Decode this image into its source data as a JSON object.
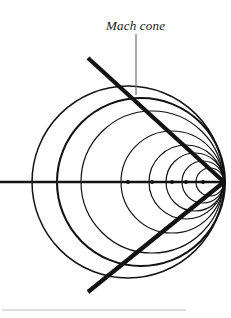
{
  "figure": {
    "title_label": "Mach cone",
    "background_color": "#ffffff",
    "line_color": "#121212",
    "leader_line_color": "#6e6e6e",
    "rule_color": "#b9b9b9",
    "apex": {
      "x": 224,
      "y": 182
    },
    "axis": {
      "y": 182,
      "x_start": 0,
      "x_end": 224,
      "stroke_width": 2.6
    },
    "cone": {
      "half_angle_deg": 45,
      "upper_line": {
        "x1": 88,
        "y1": 58,
        "x2": 224,
        "y2": 182
      },
      "lower_line": {
        "x1": 88,
        "y1": 292,
        "x2": 224,
        "y2": 182
      },
      "stroke_width": 4.2
    },
    "leader": {
      "x": 136,
      "y_top": 34,
      "y_bottom": 95,
      "stroke_width": 1.2
    },
    "bottom_rule": {
      "x1": 2,
      "x2": 186,
      "y": 310,
      "stroke_width": 1.2
    },
    "wave_circles": [
      {
        "cx": 128,
        "cy": 182,
        "r": 96,
        "stroke_width": 1.5
      },
      {
        "cx": 141,
        "cy": 182,
        "r": 84,
        "stroke_width": 2.1
      },
      {
        "cx": 152,
        "cy": 182,
        "r": 71,
        "stroke_width": 1.2
      },
      {
        "cx": 172,
        "cy": 182,
        "r": 51,
        "stroke_width": 1.2
      },
      {
        "cx": 186,
        "cy": 182,
        "r": 37,
        "stroke_width": 1.2
      },
      {
        "cx": 195,
        "cy": 182,
        "r": 29,
        "stroke_width": 1.2
      },
      {
        "cx": 203,
        "cy": 182,
        "r": 21,
        "stroke_width": 1.2
      },
      {
        "cx": 210,
        "cy": 182,
        "r": 14,
        "stroke_width": 1.2
      }
    ],
    "source_dots": [
      {
        "cx": 128,
        "cy": 182,
        "r": 2.0
      },
      {
        "cx": 152,
        "cy": 182,
        "r": 2.0
      },
      {
        "cx": 172,
        "cy": 182,
        "r": 2.0
      },
      {
        "cx": 186,
        "cy": 182,
        "r": 2.0
      },
      {
        "cx": 203,
        "cy": 182,
        "r": 2.0
      }
    ]
  },
  "chart_data": {
    "type": "diagram",
    "title": "Mach cone",
    "annotations": [
      "Mach cone"
    ],
    "apex_position": [
      224,
      182
    ],
    "mach_half_angle_deg": 45,
    "circle_centers_x": [
      128,
      141,
      152,
      172,
      186,
      195,
      203,
      210
    ],
    "circle_radii": [
      96,
      84,
      71,
      51,
      37,
      29,
      21,
      14
    ],
    "axis_y": 182
  }
}
